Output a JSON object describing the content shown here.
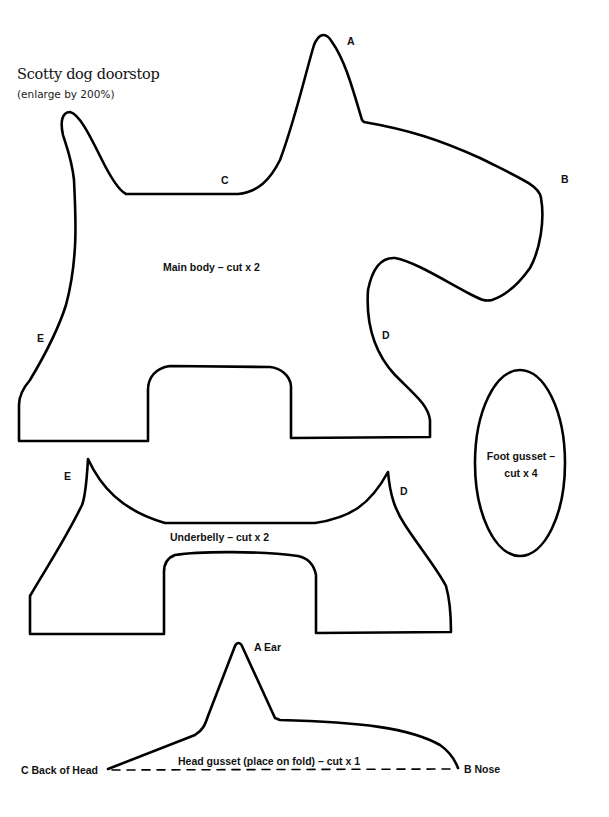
{
  "header": {
    "title": "Scotty dog doorstop",
    "subtitle": "(enlarge by 200%)"
  },
  "pieces": {
    "main_body": {
      "label": "Main body – cut x 2",
      "points": {
        "A": "A",
        "B": "B",
        "C": "C",
        "D": "D",
        "E": "E"
      }
    },
    "foot_gusset": {
      "label_line1": "Foot gusset –",
      "label_line2": "cut x 4"
    },
    "underbelly": {
      "label": "Underbelly – cut x 2",
      "points": {
        "E": "E",
        "D": "D"
      }
    },
    "head_gusset": {
      "label": "Head gusset (place on fold) – cut x 1",
      "point_ear": "A Ear",
      "point_back": "C Back of Head",
      "point_nose": "B Nose"
    }
  },
  "colors": {
    "line": "#000000",
    "background": "#ffffff"
  }
}
